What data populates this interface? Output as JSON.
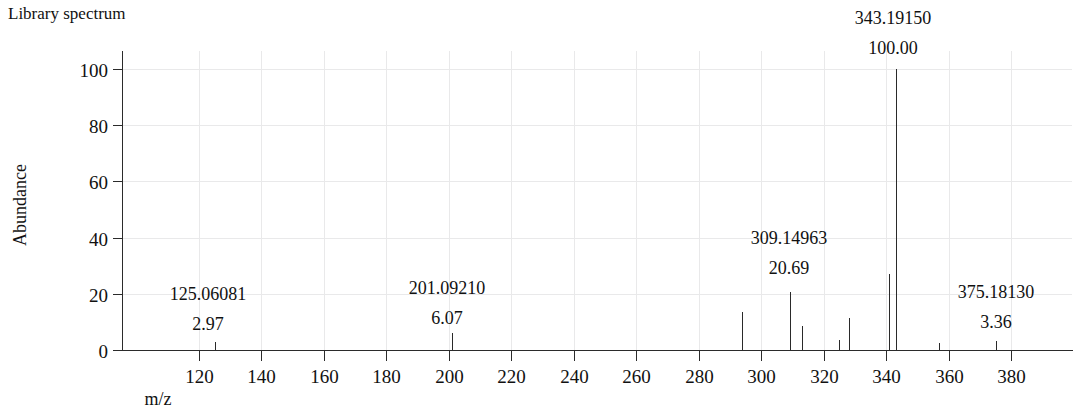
{
  "title": "Library spectrum",
  "axes": {
    "x_title": "m/z",
    "y_title": "Abundance",
    "x_ticks": [
      "120",
      "140",
      "160",
      "180",
      "200",
      "220",
      "240",
      "260",
      "280",
      "300",
      "320",
      "340",
      "360",
      "380"
    ],
    "y_ticks": [
      "0",
      "20",
      "40",
      "60",
      "80",
      "100"
    ]
  },
  "chart_data": {
    "type": "bar",
    "title": "Library spectrum",
    "xlabel": "m/z",
    "ylabel": "Abundance",
    "xlim": [
      105,
      393
    ],
    "ylim": [
      0,
      108
    ],
    "grid": true,
    "legend": null,
    "x_tick_values": [
      120,
      140,
      160,
      180,
      200,
      220,
      240,
      260,
      280,
      300,
      320,
      340,
      360,
      380
    ],
    "y_tick_values": [
      0,
      20,
      40,
      60,
      80,
      100
    ],
    "x": [
      125.06081,
      201.0921,
      294.0,
      309.14963,
      313.0,
      325.0,
      328.0,
      341.0,
      343.1915,
      357.0,
      375.1813
    ],
    "values": [
      2.97,
      6.07,
      13.5,
      20.69,
      8.5,
      3.5,
      11.5,
      27.0,
      100.0,
      2.5,
      3.36
    ],
    "labeled_peaks": [
      {
        "mz": "125.06081",
        "abundance": "2.97",
        "mz_value": 125.06081,
        "abundance_value": 2.97
      },
      {
        "mz": "201.09210",
        "abundance": "6.07",
        "mz_value": 201.0921,
        "abundance_value": 6.07
      },
      {
        "mz": "309.14963",
        "abundance": "20.69",
        "mz_value": 309.14963,
        "abundance_value": 20.69
      },
      {
        "mz": "343.19150",
        "abundance": "100.00",
        "mz_value": 343.1915,
        "abundance_value": 100.0
      },
      {
        "mz": "375.18130",
        "abundance": "3.36",
        "mz_value": 375.1813,
        "abundance_value": 3.36
      }
    ],
    "unlabeled_peaks": [
      {
        "mz_value": 294.0,
        "abundance_value": 13.5
      },
      {
        "mz_value": 313.0,
        "abundance_value": 8.5
      },
      {
        "mz_value": 325.0,
        "abundance_value": 3.5
      },
      {
        "mz_value": 328.0,
        "abundance_value": 11.5
      },
      {
        "mz_value": 341.0,
        "abundance_value": 27.0
      },
      {
        "mz_value": 357.0,
        "abundance_value": 2.5
      }
    ]
  },
  "peak_labels": [
    {
      "mz": "125.06081",
      "abundance": "2.97",
      "x": 208,
      "mz_y": 300,
      "ab_y": 330
    },
    {
      "mz": "201.09210",
      "abundance": "6.07",
      "x": 447,
      "mz_y": 294,
      "ab_y": 324
    },
    {
      "mz": "309.14963",
      "abundance": "20.69",
      "x": 789,
      "mz_y": 244,
      "ab_y": 274
    },
    {
      "mz": "343.19150",
      "abundance": "100.00",
      "x": 893,
      "mz_y": 24,
      "ab_y": 54
    },
    {
      "mz": "375.18130",
      "abundance": "3.36",
      "x": 996,
      "mz_y": 298,
      "ab_y": 328
    }
  ],
  "colors": {
    "peak": "#2a2a2a",
    "axis": "#2b2b2b",
    "grid": "#e9e9ea",
    "text": "#111111",
    "background": "#ffffff"
  }
}
